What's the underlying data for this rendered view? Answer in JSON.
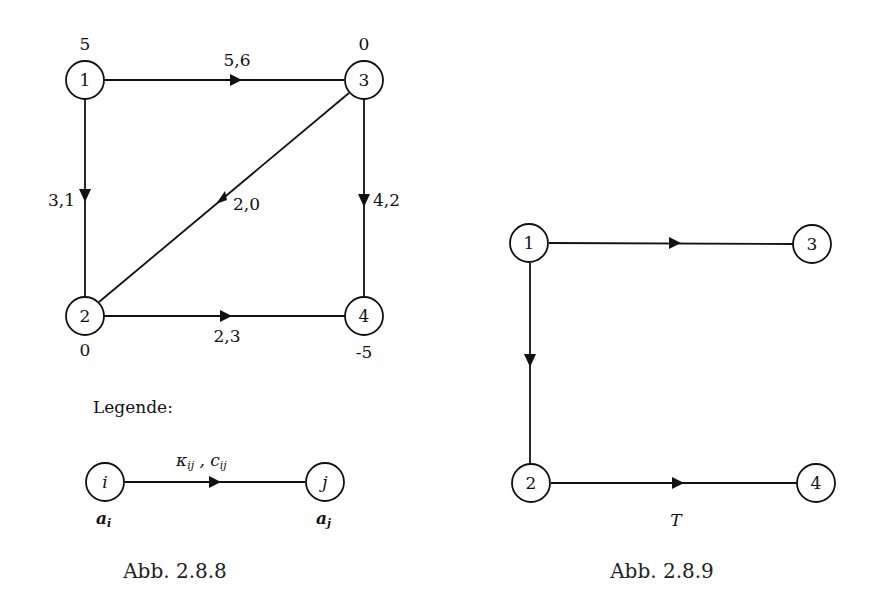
{
  "figure_left": {
    "caption": "Abb. 2.8.8",
    "nodes": [
      {
        "id": "1",
        "supply": "5"
      },
      {
        "id": "2",
        "supply": "0"
      },
      {
        "id": "3",
        "supply": "0"
      },
      {
        "id": "4",
        "supply": "-5"
      }
    ],
    "edges": [
      {
        "from": "1",
        "to": "3",
        "label": "5,6"
      },
      {
        "from": "1",
        "to": "2",
        "label": "3,1"
      },
      {
        "from": "2",
        "to": "3",
        "label": "2,0"
      },
      {
        "from": "3",
        "to": "4",
        "label": "4,2"
      },
      {
        "from": "2",
        "to": "4",
        "label": "2,3"
      }
    ],
    "legend": {
      "title": "Legende:",
      "node_i": "i",
      "node_j": "j",
      "edge_label": "κij , cij",
      "edge_label_kappa": "κ",
      "edge_label_c": "c",
      "sub_ij": "ij",
      "a_i_base": "a",
      "a_i_sub": "i",
      "a_j_base": "a",
      "a_j_sub": "j"
    }
  },
  "figure_right": {
    "caption": "Abb. 2.8.9",
    "tree_label": "T",
    "nodes": [
      {
        "id": "1"
      },
      {
        "id": "2"
      },
      {
        "id": "3"
      },
      {
        "id": "4"
      }
    ],
    "edges": [
      {
        "from": "1",
        "to": "3"
      },
      {
        "from": "1",
        "to": "2"
      },
      {
        "from": "2",
        "to": "4"
      }
    ]
  }
}
